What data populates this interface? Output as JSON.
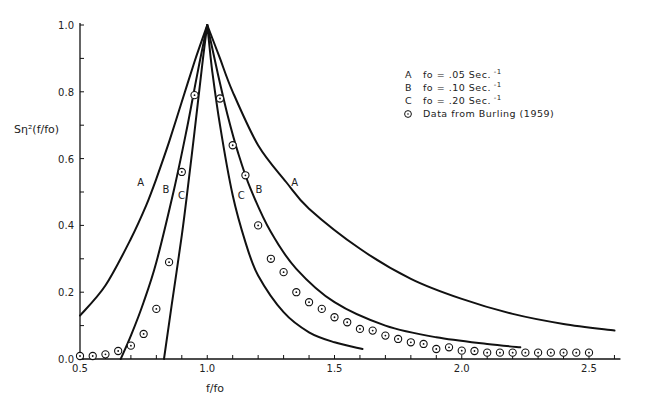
{
  "chart_data": {
    "type": "line",
    "title": "",
    "xlabel": "f/fo",
    "ylabel": "Sη²(f/fo)",
    "xlim": [
      0.5,
      2.6
    ],
    "ylim": [
      0.0,
      1.0
    ],
    "grid": false,
    "legend_position": "upper right",
    "x_ticks": [
      0.5,
      1.0,
      1.5,
      2.0,
      2.5
    ],
    "x_tick_labels": [
      "0.5",
      "1.0",
      "1.5",
      "2.0",
      "2.5"
    ],
    "x_minor_step": 0.1,
    "y_ticks": [
      0.0,
      0.2,
      0.4,
      0.6,
      0.8,
      1.0
    ],
    "y_tick_labels": [
      "0.0",
      "0.2",
      "0.4",
      "0.6",
      "0.8",
      "1.0"
    ],
    "y_minor_step": 0.1,
    "legend": [
      {
        "key": "A",
        "text": "fo = .05 Sec.",
        "superscript": "-1"
      },
      {
        "key": "B",
        "text": "fo = .10 Sec.",
        "superscript": "-1"
      },
      {
        "key": "C",
        "text": "fo = .20 Sec.",
        "superscript": "-1"
      },
      {
        "key": "⊙",
        "text": "Data from Burling (1959)",
        "superscript": ""
      }
    ],
    "series": [
      {
        "name": "A",
        "label": "fo = .05 Sec.^-1",
        "style": "line",
        "x": [
          0.5,
          0.6,
          0.7,
          0.76,
          0.8,
          0.85,
          0.9,
          0.95,
          1.0,
          1.05,
          1.1,
          1.2,
          1.31,
          1.4,
          1.6,
          1.8,
          2.0,
          2.2,
          2.4,
          2.6
        ],
        "y": [
          0.13,
          0.22,
          0.36,
          0.46,
          0.54,
          0.65,
          0.77,
          0.89,
          1.0,
          0.9,
          0.8,
          0.64,
          0.53,
          0.45,
          0.33,
          0.24,
          0.18,
          0.135,
          0.105,
          0.085
        ],
        "label_positions": [
          {
            "x": 0.76,
            "y": 0.53
          },
          {
            "x": 1.31,
            "y": 0.53
          }
        ]
      },
      {
        "name": "B",
        "label": "fo = .10 Sec.^-1",
        "style": "line",
        "x": [
          0.66,
          0.7,
          0.75,
          0.8,
          0.87,
          0.92,
          0.96,
          1.0,
          1.04,
          1.08,
          1.12,
          1.17,
          1.25,
          1.35,
          1.5,
          1.7,
          1.9,
          2.1,
          2.23
        ],
        "y": [
          0.0,
          0.07,
          0.17,
          0.29,
          0.51,
          0.69,
          0.85,
          1.0,
          0.86,
          0.73,
          0.62,
          0.51,
          0.38,
          0.27,
          0.17,
          0.1,
          0.065,
          0.045,
          0.035
        ],
        "label_positions": [
          {
            "x": 0.86,
            "y": 0.51
          },
          {
            "x": 1.17,
            "y": 0.51
          }
        ]
      },
      {
        "name": "C",
        "label": "fo = .20 Sec.^-1",
        "style": "line",
        "x": [
          0.83,
          0.86,
          0.9,
          0.92,
          0.95,
          0.98,
          1.0,
          1.02,
          1.05,
          1.1,
          1.15,
          1.2,
          1.3,
          1.4,
          1.5,
          1.61
        ],
        "y": [
          0.0,
          0.16,
          0.37,
          0.49,
          0.68,
          0.88,
          1.0,
          0.86,
          0.7,
          0.49,
          0.35,
          0.25,
          0.14,
          0.08,
          0.05,
          0.03
        ],
        "label_positions": [
          {
            "x": 0.92,
            "y": 0.49
          },
          {
            "x": 1.1,
            "y": 0.49
          }
        ]
      },
      {
        "name": "Data from Burling (1959)",
        "style": "scatter",
        "marker": "circled-dot",
        "x": [
          0.5,
          0.55,
          0.6,
          0.65,
          0.7,
          0.75,
          0.8,
          0.85,
          0.9,
          0.95,
          1.05,
          1.1,
          1.15,
          1.2,
          1.25,
          1.3,
          1.35,
          1.4,
          1.45,
          1.5,
          1.55,
          1.6,
          1.65,
          1.7,
          1.75,
          1.8,
          1.85,
          1.9,
          1.95,
          2.0,
          2.05,
          2.1,
          2.15,
          2.2,
          2.25,
          2.3,
          2.35,
          2.4,
          2.45,
          2.5
        ],
        "y": [
          0.0,
          0.0,
          0.005,
          0.015,
          0.04,
          0.075,
          0.15,
          0.29,
          0.56,
          0.79,
          0.78,
          0.64,
          0.55,
          0.4,
          0.3,
          0.26,
          0.2,
          0.17,
          0.15,
          0.125,
          0.11,
          0.09,
          0.085,
          0.07,
          0.06,
          0.05,
          0.045,
          0.03,
          0.035,
          0.025,
          0.015,
          0.01,
          0.01,
          0.01,
          0.01,
          0.01,
          0.01,
          0.01,
          0.01,
          0.01
        ]
      }
    ]
  }
}
